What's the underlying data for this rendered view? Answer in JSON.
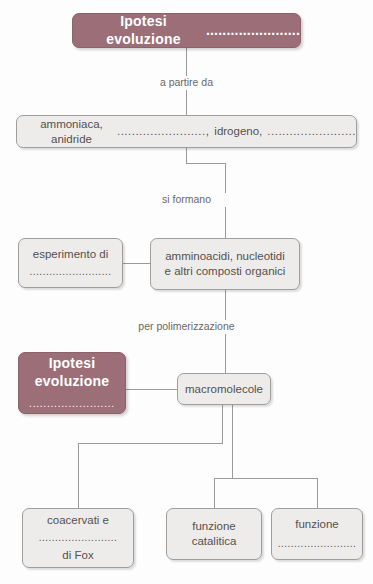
{
  "diagram": {
    "title_node": {
      "label": "Ipotesi evoluzione",
      "blank": "......................."
    },
    "gases_node": {
      "text_before": "ammoniaca, anidride",
      "blank1": "........................,",
      "text_middle": "idrogeno,",
      "blank2": "........................"
    },
    "experiment_node": {
      "label": "esperimento di",
      "blank": "........................."
    },
    "monomers_node": {
      "line1": "amminoacidi, nucleotidi",
      "line2": "e altri composti organici"
    },
    "hypothesis2_node": {
      "line1": "Ipotesi",
      "line2": "evoluzione",
      "blank": "........................"
    },
    "macromolecules_node": {
      "label": "macromolecole"
    },
    "coacervates_node": {
      "line1": "coacervati e",
      "blank": "........................",
      "line2": "di Fox"
    },
    "catalytic_node": {
      "line1": "funzione",
      "line2": "catalitica"
    },
    "function_node": {
      "line1": "funzione",
      "blank": "........................"
    },
    "connectors": {
      "a_partire_da": "a partire da",
      "si_formano": "si formano",
      "per_polimerizzazione": "per polimerizzazione"
    },
    "colors": {
      "accent_dark": "#9c6f78",
      "box_fill": "#eeecea",
      "box_border": "#9e9e9e",
      "line": "#9a9a9a",
      "text": "#55504f",
      "caption_text": "#6b6766"
    }
  }
}
